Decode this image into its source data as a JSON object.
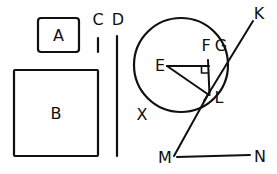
{
  "figure": {
    "background_color": "#ffffff",
    "stroke_color": "#101010",
    "width": 277,
    "height": 174,
    "shapes": {
      "rect_a": {
        "label": "A",
        "x": 38,
        "y": 18,
        "width": 41,
        "height": 34,
        "corner_radius": 3,
        "label_x": 58.5,
        "label_y": 41
      },
      "rect_b": {
        "label": "B",
        "x": 14,
        "y": 70,
        "width": 84,
        "height": 86,
        "corner_radius": 1,
        "label_x": 56,
        "label_y": 119
      },
      "circle": {
        "cx": 181,
        "cy": 65,
        "r": 47
      },
      "tick_c": {
        "label": "C",
        "x": 98,
        "y_top": 38,
        "y_bottom": 52,
        "label_x": 98,
        "label_y": 25
      },
      "line_d": {
        "label": "D",
        "x": 117,
        "y_top": 36,
        "y_bottom": 156,
        "label_x": 117,
        "label_y": 25
      }
    },
    "points": [
      {
        "name": "E",
        "label": "E",
        "x": 167,
        "y": 66,
        "label_x": 160,
        "label_y": 71
      },
      {
        "name": "F",
        "label": "F",
        "x": 208,
        "y": 66,
        "label_x": 205,
        "label_y": 50
      },
      {
        "name": "G",
        "label": "G",
        "x": 219,
        "y": 66,
        "label_x": 220,
        "label_y": 50
      },
      {
        "name": "L",
        "label": "L",
        "x": 209,
        "y": 95,
        "label_x": 218,
        "label_y": 102
      },
      {
        "name": "K",
        "label": "K",
        "x": 253,
        "y": 17,
        "label_x": 258,
        "label_y": 18
      },
      {
        "name": "M",
        "label": "M",
        "x": 172,
        "y": 158,
        "label_x": 163,
        "label_y": 162
      },
      {
        "name": "N",
        "label": "N",
        "x": 253,
        "y": 158,
        "label_x": 258,
        "label_y": 161
      },
      {
        "name": "X",
        "label": "X",
        "x": 145,
        "y": 112,
        "label_x": 141,
        "label_y": 119
      }
    ],
    "segments": [
      {
        "name": "segment-E-F",
        "x1": 167,
        "y1": 66,
        "x2": 209,
        "y2": 66
      },
      {
        "name": "segment-E-L",
        "x1": 167,
        "y1": 66,
        "x2": 209,
        "y2": 95
      },
      {
        "name": "segment-F-L",
        "x1": 208,
        "y1": 62,
        "x2": 209,
        "y2": 95
      },
      {
        "name": "segment-L-K",
        "x1": 205,
        "y1": 99,
        "x2": 253,
        "y2": 22
      },
      {
        "name": "segment-L-M",
        "x1": 209,
        "y1": 92,
        "x2": 174,
        "y2": 156
      },
      {
        "name": "segment-M-N",
        "x1": 176,
        "y1": 157,
        "x2": 250,
        "y2": 155
      }
    ],
    "right_angle_marker": {
      "name": "right-angle-at-F",
      "x": 202,
      "y": 66,
      "size": 7
    }
  }
}
